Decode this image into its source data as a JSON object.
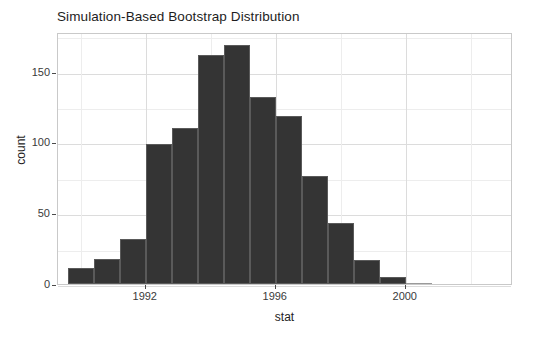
{
  "chart_data": {
    "type": "bar",
    "title": "Simulation-Based Bootstrap Distribution",
    "xlabel": "stat",
    "ylabel": "count",
    "categories": [
      1990.0,
      1990.8,
      1991.6,
      1992.4,
      1993.2,
      1994.0,
      1994.8,
      1995.6,
      1996.4,
      1997.2,
      1998.0,
      1998.8,
      1999.6,
      2000.4
    ],
    "values": [
      11,
      18,
      32,
      99,
      110,
      162,
      169,
      132,
      119,
      76,
      43,
      17,
      5,
      0
    ],
    "bin_width": 0.8,
    "xlim": [
      1989.3,
      2003.3
    ],
    "ylim": [
      0,
      178
    ],
    "x_ticks": [
      1992,
      1996,
      2000
    ],
    "x_tick_labels": [
      "1992",
      "1996",
      "2000"
    ],
    "x_minor_ticks": [
      1990,
      1994,
      1998,
      2002
    ],
    "y_ticks": [
      0,
      50,
      100,
      150
    ],
    "y_tick_labels": [
      "0",
      "50",
      "100",
      "150"
    ],
    "y_minor_ticks": [
      25,
      75,
      125,
      175
    ],
    "grid": true,
    "legend": "none",
    "bar_color": "#343434",
    "bar_border_color": "#5a5a5a",
    "panel_background": "#ffffff",
    "gridline_color": "#dcdcdc",
    "minor_gridline_color": "#ededed",
    "panel_border_color": "#c9c9c9"
  },
  "chart": {
    "title": "Simulation-Based Bootstrap Distribution",
    "x_axis_title": "stat",
    "y_axis_title": "count"
  }
}
